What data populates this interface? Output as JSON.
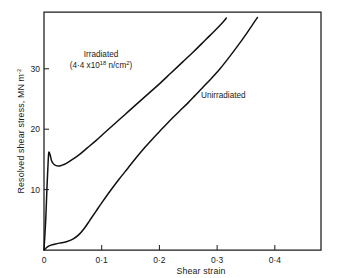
{
  "chart_data": {
    "type": "line",
    "title": "",
    "xlabel": "Shear strain",
    "ylabel": "Resolved shear stress, MN m",
    "ylabel_superscript": "-2",
    "xlim": [
      0,
      0.48
    ],
    "ylim": [
      0,
      39.4
    ],
    "grid": false,
    "legend_position": "inline-annotations",
    "xticks": [
      0,
      0.1,
      0.2,
      0.3,
      0.4
    ],
    "xticklabels": [
      "0",
      "0·1",
      "0·2",
      "0·3",
      "0·4"
    ],
    "yticks": [
      10,
      20,
      30
    ],
    "yticklabels": [
      "10",
      "20",
      "30"
    ],
    "series": [
      {
        "name": "Irradiated",
        "annotation_line1": "Irradiated",
        "annotation_line2_prefix": "(4·4 x10",
        "annotation_line2_exponent": "18",
        "annotation_line2_suffix": " n/cm",
        "annotation_line2_unit_exponent": "2",
        "annotation_line2_close": ")",
        "points": [
          [
            0.0,
            0.0
          ],
          [
            0.003,
            5.0
          ],
          [
            0.005,
            10.0
          ],
          [
            0.007,
            14.2
          ],
          [
            0.008,
            15.9
          ],
          [
            0.009,
            16.2
          ],
          [
            0.011,
            15.6
          ],
          [
            0.013,
            14.8
          ],
          [
            0.016,
            14.3
          ],
          [
            0.02,
            14.0
          ],
          [
            0.025,
            13.9
          ],
          [
            0.03,
            14.0
          ],
          [
            0.038,
            14.3
          ],
          [
            0.048,
            14.9
          ],
          [
            0.06,
            15.7
          ],
          [
            0.075,
            16.9
          ],
          [
            0.09,
            18.1
          ],
          [
            0.105,
            19.4
          ],
          [
            0.12,
            20.7
          ],
          [
            0.14,
            22.4
          ],
          [
            0.16,
            24.1
          ],
          [
            0.18,
            25.8
          ],
          [
            0.2,
            27.5
          ],
          [
            0.22,
            29.3
          ],
          [
            0.24,
            31.1
          ],
          [
            0.26,
            32.9
          ],
          [
            0.28,
            34.8
          ],
          [
            0.295,
            36.2
          ],
          [
            0.31,
            37.7
          ],
          [
            0.316,
            38.4
          ]
        ]
      },
      {
        "name": "Unirradiated",
        "annotation_line1": "Unirradiated",
        "points": [
          [
            0.0,
            0.0
          ],
          [
            0.006,
            0.5
          ],
          [
            0.012,
            0.8
          ],
          [
            0.02,
            1.0
          ],
          [
            0.03,
            1.2
          ],
          [
            0.04,
            1.4
          ],
          [
            0.05,
            1.8
          ],
          [
            0.06,
            2.5
          ],
          [
            0.07,
            3.6
          ],
          [
            0.08,
            5.0
          ],
          [
            0.09,
            6.4
          ],
          [
            0.1,
            7.8
          ],
          [
            0.115,
            9.8
          ],
          [
            0.13,
            11.7
          ],
          [
            0.145,
            13.5
          ],
          [
            0.16,
            15.3
          ],
          [
            0.175,
            17.0
          ],
          [
            0.19,
            18.6
          ],
          [
            0.205,
            20.1
          ],
          [
            0.22,
            21.6
          ],
          [
            0.235,
            23.0
          ],
          [
            0.25,
            24.4
          ],
          [
            0.262,
            25.6
          ],
          [
            0.275,
            26.9
          ],
          [
            0.29,
            28.4
          ],
          [
            0.305,
            30.0
          ],
          [
            0.32,
            31.8
          ],
          [
            0.335,
            33.7
          ],
          [
            0.35,
            35.7
          ],
          [
            0.362,
            37.4
          ],
          [
            0.37,
            38.5
          ]
        ]
      }
    ]
  },
  "colors": {
    "ink": "#1a1a1a",
    "curve": "#111111",
    "background": "#ffffff"
  }
}
